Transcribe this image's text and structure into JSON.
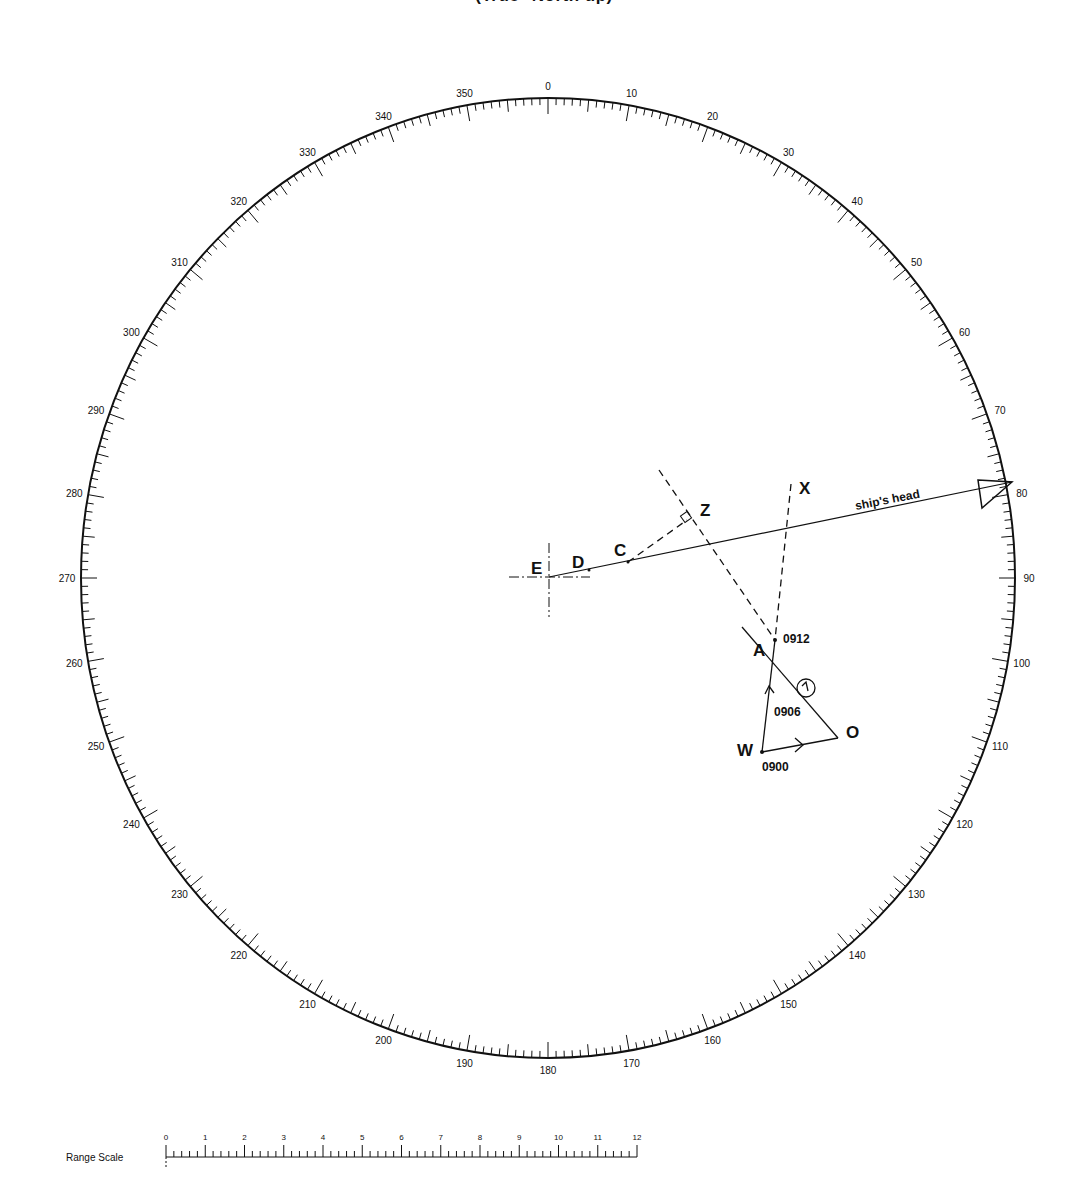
{
  "title": "(True° North up)",
  "plot": {
    "center": [
      548,
      578
    ],
    "rx": 467,
    "ry": 480,
    "bearing_labels": [
      "0",
      "10",
      "20",
      "30",
      "40",
      "50",
      "60",
      "70",
      "80",
      "90",
      "100",
      "110",
      "120",
      "130",
      "140",
      "150",
      "160",
      "170",
      "180",
      "190",
      "200",
      "210",
      "220",
      "230",
      "240",
      "250",
      "260",
      "270",
      "280",
      "290",
      "300",
      "310",
      "320",
      "330",
      "340",
      "350"
    ]
  },
  "points": {
    "E": {
      "label": "E",
      "x": 549,
      "y": 577
    },
    "D": {
      "label": "D",
      "x": 589,
      "y": 570
    },
    "C": {
      "label": "C",
      "x": 628,
      "y": 562
    },
    "Z": {
      "label": "Z",
      "x": 687,
      "y": 518
    },
    "X": {
      "label": "X",
      "x": 792,
      "y": 482
    },
    "A": {
      "label": "A",
      "x": 775,
      "y": 640
    },
    "W": {
      "label": "W",
      "x": 762,
      "y": 752
    },
    "O": {
      "label": "O",
      "x": 838,
      "y": 738
    }
  },
  "annotations": {
    "ships_head": "ship's head",
    "t0912": "0912",
    "t0906": "0906",
    "t0900": "0900"
  },
  "range_scale": {
    "label": "Range Scale",
    "ticks": [
      "0",
      "1",
      "2",
      "3",
      "4",
      "5",
      "6",
      "7",
      "8",
      "9",
      "10",
      "11",
      "12"
    ]
  }
}
